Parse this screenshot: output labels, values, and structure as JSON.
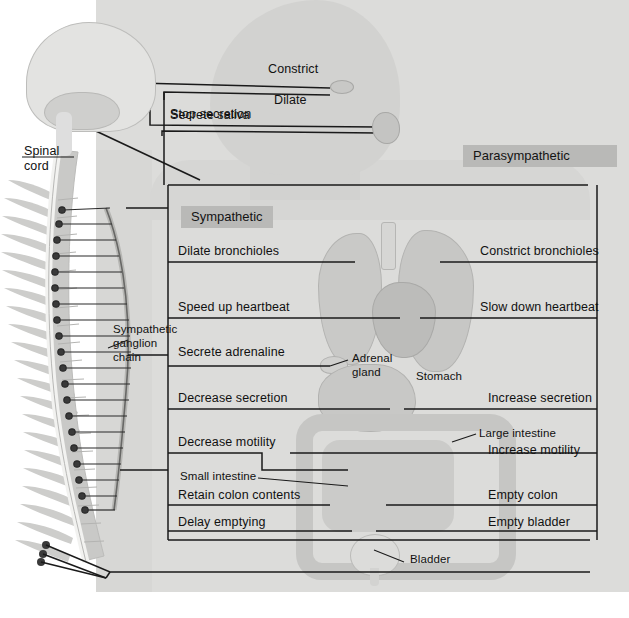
{
  "figure": {
    "banners": {
      "sympathetic": "Sympathetic",
      "parasympathetic": "Parasympathetic"
    }
  },
  "anatomy_labels": [
    {
      "id": "spinal-cord",
      "text_line1": "Spinal",
      "text_line2": "cord"
    },
    {
      "id": "sympathetic-ganglion-chain",
      "text_line1": "Sympathetic",
      "text_line2": "ganglion",
      "text_line3": "chain"
    },
    {
      "id": "adrenal-gland",
      "text_line1": "Adrenal",
      "text_line2": "gland"
    },
    {
      "id": "stomach",
      "text_line1": "Stomach"
    },
    {
      "id": "large-intestine",
      "text_line1": "Large intestine"
    },
    {
      "id": "small-intestine",
      "text_line1": "Small intestine"
    },
    {
      "id": "bladder",
      "text_line1": "Bladder"
    }
  ],
  "sympathetic_effects": [
    {
      "organ": "eye",
      "label": "Dilate"
    },
    {
      "organ": "salivary-gland",
      "label": "Stop secretion"
    },
    {
      "organ": "bronchioles",
      "label": "Dilate bronchioles"
    },
    {
      "organ": "heart",
      "label": "Speed up heartbeat"
    },
    {
      "organ": "adrenal-gland",
      "label": "Secrete adrenaline"
    },
    {
      "organ": "stomach",
      "label": "Decrease secretion"
    },
    {
      "organ": "intestine",
      "label": "Decrease motility"
    },
    {
      "organ": "colon",
      "label": "Retain colon contents"
    },
    {
      "organ": "bladder",
      "label": "Delay emptying"
    }
  ],
  "parasympathetic_effects": [
    {
      "organ": "eye",
      "label": "Constrict"
    },
    {
      "organ": "salivary-gland",
      "label": "Secrete saliva"
    },
    {
      "organ": "bronchioles",
      "label": "Constrict bronchioles"
    },
    {
      "organ": "heart",
      "label": "Slow down heartbeat"
    },
    {
      "organ": "stomach",
      "label": "Increase secretion"
    },
    {
      "organ": "intestine",
      "label": "Increase motility"
    },
    {
      "organ": "colon",
      "label": "Empty colon"
    },
    {
      "organ": "bladder",
      "label": "Empty bladder"
    }
  ],
  "colors": {
    "page_background": "#ffffff",
    "body_tint": "#dcdcda",
    "banner_fill": "#b9b9b7",
    "line_stroke": "#1a1a1a",
    "organ_fill": "#c6c6c4",
    "text": "#111111"
  }
}
